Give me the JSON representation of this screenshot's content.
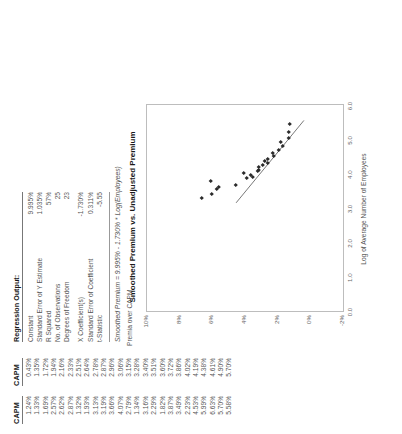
{
  "columns": {
    "capm_unadjusted": {
      "header": "CAPM",
      "values": [
        "1.24%",
        "1.33%",
        "1.69%",
        "2.57%",
        "2.62%",
        "2.87%",
        "1.32%",
        "1.93%",
        "3.13%",
        "3.19%",
        "3.66%",
        "4.07%",
        "2.79%",
        "1.34%",
        "3.16%",
        "2.29%",
        "1.82%",
        "3.87%",
        "3.49%",
        "2.23%",
        "4.53%",
        "5.99%",
        "6.63%",
        "5.70%",
        "5.58%"
      ]
    },
    "capm_smoothed": {
      "header": "CAPM",
      "values": [
        "0.43%",
        "1.35%",
        "1.72%",
        "1.94%",
        "2.16%",
        "2.33%",
        "2.51%",
        "2.64%",
        "2.78%",
        "2.87%",
        "2.96%",
        "3.06%",
        "3.15%",
        "3.28%",
        "3.40%",
        "3.51%",
        "3.60%",
        "3.72%",
        "3.86%",
        "4.02%",
        "4.19%",
        "4.38%",
        "4.61%",
        "4.90%",
        "5.70%"
      ]
    }
  },
  "regression": {
    "title": "Regression Output:",
    "rows": [
      {
        "label": "Constant",
        "value": "9.995%"
      },
      {
        "label": "Standard Error of Y Estimate",
        "value": "1.035%"
      },
      {
        "label": "R Squared",
        "value": "57%"
      },
      {
        "label": "No. of Observations",
        "value": "25"
      },
      {
        "label": "Degrees of Freedom",
        "value": "23"
      }
    ],
    "rows2": [
      {
        "label": "X Coefficient(s)",
        "value": "-1.730%"
      },
      {
        "label": "Standard Error of Coefficient",
        "value": "0.311%"
      },
      {
        "label": "t-Statistic",
        "value": "-5.55"
      }
    ],
    "equation": "Smoothed Premium  =  9.995%  -  1.730% * Log(Employees)"
  },
  "chart_data": {
    "type": "scatter",
    "title": "Smoothed Premium vs. Unadjusted Premium",
    "xlabel": "Log of Average Number of Employees",
    "ylabel": "Premia over CAPM",
    "xlim": [
      0.0,
      6.0
    ],
    "ylim": [
      -0.02,
      0.1
    ],
    "xticks": [
      "0.0",
      "1.0",
      "2.0",
      "3.0",
      "4.0",
      "5.0",
      "6.0"
    ],
    "yticks": [
      "-2%",
      "0%",
      "2%",
      "4%",
      "6%",
      "8%",
      "10%"
    ],
    "grid": false,
    "legend": false,
    "points": [
      {
        "x": 3.3,
        "y": 0.0663
      },
      {
        "x": 3.42,
        "y": 0.0599
      },
      {
        "x": 3.55,
        "y": 0.057
      },
      {
        "x": 3.62,
        "y": 0.0558
      },
      {
        "x": 3.68,
        "y": 0.0453
      },
      {
        "x": 3.8,
        "y": 0.0607
      },
      {
        "x": 3.86,
        "y": 0.0387
      },
      {
        "x": 3.9,
        "y": 0.0349
      },
      {
        "x": 3.95,
        "y": 0.0366
      },
      {
        "x": 4.02,
        "y": 0.0407
      },
      {
        "x": 4.08,
        "y": 0.0319
      },
      {
        "x": 4.12,
        "y": 0.0313
      },
      {
        "x": 4.18,
        "y": 0.0316
      },
      {
        "x": 4.25,
        "y": 0.0287
      },
      {
        "x": 4.3,
        "y": 0.0262
      },
      {
        "x": 4.36,
        "y": 0.0279
      },
      {
        "x": 4.44,
        "y": 0.0257
      },
      {
        "x": 4.52,
        "y": 0.0223
      },
      {
        "x": 4.6,
        "y": 0.0229
      },
      {
        "x": 4.68,
        "y": 0.0193
      },
      {
        "x": 4.8,
        "y": 0.0169
      },
      {
        "x": 4.92,
        "y": 0.0182
      },
      {
        "x": 5.05,
        "y": 0.0132
      },
      {
        "x": 5.2,
        "y": 0.0133
      },
      {
        "x": 5.45,
        "y": 0.0124
      }
    ],
    "trendline": {
      "intercept": 0.09995,
      "slope": -0.0173,
      "x_start": 3.15,
      "x_end": 5.55
    }
  }
}
